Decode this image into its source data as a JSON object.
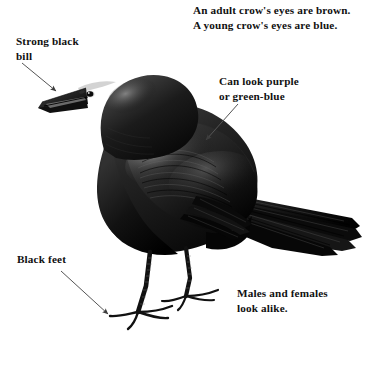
{
  "figure": {
    "subject": "crow",
    "background_color": "#ffffff",
    "ink_color": "#111111",
    "arrow_color": "#555555"
  },
  "labels": {
    "eyes": "An adult crow's eyes are brown.\nA young crow's eyes are blue.",
    "bill": "Strong black\nbill",
    "sheen": "Can look purple\nor green-blue",
    "feet": "Black feet",
    "sexes": "Males and females\nlook alike."
  },
  "arrows": [
    {
      "name": "arrow-to-bill",
      "from": [
        22,
        63
      ],
      "to": [
        56,
        91
      ]
    },
    {
      "name": "arrow-to-wing",
      "from": [
        238,
        104
      ],
      "to": [
        206,
        140
      ]
    },
    {
      "name": "arrow-to-feet",
      "from": [
        61,
        271
      ],
      "to": [
        108,
        314
      ]
    }
  ],
  "illustration": {
    "name": "crow-illustration",
    "parts": [
      "head",
      "bill",
      "eye",
      "body",
      "wing",
      "tail",
      "legs",
      "feet"
    ]
  }
}
